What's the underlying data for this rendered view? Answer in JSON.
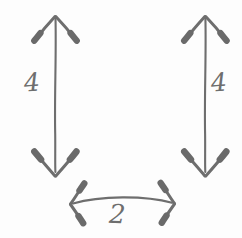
{
  "diagram": {
    "kind": "hand-drawn-dimension-sketch",
    "background_color": "#fdfdfd",
    "stroke_color": "#6e6e6e",
    "ink_color": "#6e6e6e",
    "arrows": [
      {
        "id": "left-vertical",
        "orientation": "vertical",
        "heads": "both",
        "label": "4",
        "label_side": "left"
      },
      {
        "id": "right-vertical",
        "orientation": "vertical",
        "heads": "both",
        "label": "4",
        "label_side": "right"
      },
      {
        "id": "bottom-horizontal",
        "orientation": "horizontal",
        "heads": "both",
        "curved": true,
        "label": "2",
        "label_side": "below"
      }
    ],
    "labels": {
      "left": "4",
      "right": "4",
      "bottom": "2"
    }
  }
}
